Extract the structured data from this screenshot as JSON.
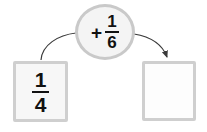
{
  "diagram": {
    "type": "fraction-addition-flow",
    "left_box": {
      "name": "start-value",
      "fraction": {
        "numerator": "1",
        "denominator": "4"
      },
      "filled": true
    },
    "operation_circle": {
      "name": "operation",
      "operator": "+",
      "fraction": {
        "numerator": "1",
        "denominator": "6"
      }
    },
    "right_box": {
      "name": "result-value",
      "fraction": {
        "numerator": "",
        "denominator": ""
      },
      "filled": false,
      "empty": true
    },
    "arrows": [
      {
        "name": "arrow-from-start",
        "from": "left-box",
        "to": "operation-circle",
        "arrowhead": false
      },
      {
        "name": "arrow-to-result",
        "from": "operation-circle",
        "to": "right-box",
        "arrowhead": true
      }
    ],
    "colors": {
      "box_border": "#cfcfcf",
      "circle_border": "#c9c9c9",
      "circle_fill": "#f4f4f4",
      "box_fill": "#f7f7f7",
      "text": "#111111",
      "arrow": "#3a3a3a",
      "background": "#ffffff"
    }
  }
}
